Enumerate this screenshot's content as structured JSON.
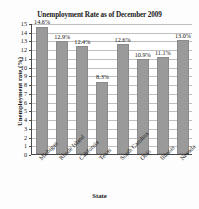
{
  "chart_data": {
    "type": "bar",
    "title": "Unemployment Rate as of December 2009",
    "xlabel": "State",
    "ylabel": "Unemployment rate (%)",
    "categories": [
      "Michigan",
      "Rhode Island",
      "California",
      "Texas",
      "South Carolina",
      "Ohio",
      "Illinois",
      "Nevada"
    ],
    "values": [
      14.6,
      12.9,
      12.4,
      8.3,
      12.6,
      10.9,
      11.1,
      13.0
    ],
    "data_labels": [
      "14.6%",
      "12.9%",
      "12.4%",
      "8.3%",
      "12.6%",
      "10.9%",
      "11.1%",
      "13.0%"
    ],
    "ylim": [
      0,
      15
    ],
    "ytick_labels": [
      "15",
      "14",
      "13",
      "12",
      "11",
      "10",
      "9",
      "8",
      "7",
      "6",
      "5",
      "4",
      "3",
      "2",
      "1",
      "0"
    ],
    "ytick_values": [
      15,
      14,
      13,
      12,
      11,
      10,
      9,
      8,
      7,
      6,
      5,
      4,
      3,
      2,
      1,
      0
    ],
    "grid": true,
    "legend": false,
    "bar_color": "#9a9a9a",
    "grid_color": "#bfbfbf",
    "axis_color": "#4a4a4a"
  }
}
